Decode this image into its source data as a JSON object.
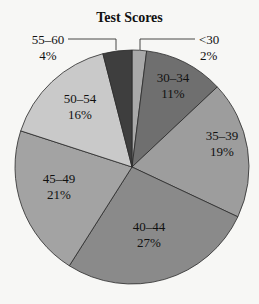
{
  "chart_data": {
    "type": "pie",
    "title": "Test Scores",
    "categories": [
      "<30",
      "30–34",
      "35–39",
      "40–44",
      "45–49",
      "50–54",
      "55–60"
    ],
    "values": [
      2,
      11,
      19,
      27,
      21,
      16,
      4
    ],
    "labels": [
      "2%",
      "11%",
      "19%",
      "27%",
      "21%",
      "16%",
      "4%"
    ],
    "colors": [
      "#a9a9a9",
      "#6f6f6f",
      "#9d9d9d",
      "#8a8a8a",
      "#a3a3a3",
      "#c9c9c9",
      "#3e3e3e"
    ],
    "start_angle_deg": 0,
    "direction": "clockwise",
    "legend": "none",
    "callouts": [
      "<30",
      "55–60"
    ]
  }
}
